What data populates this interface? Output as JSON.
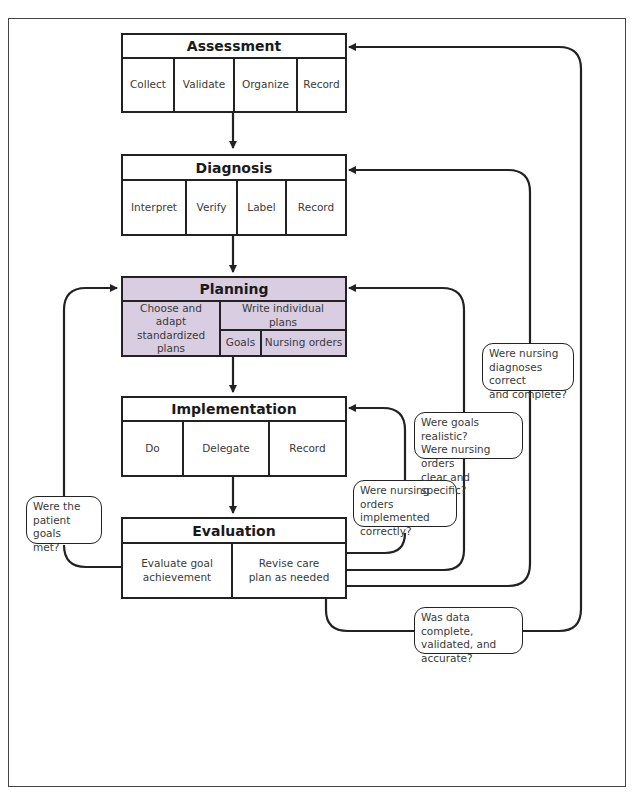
{
  "diagram": {
    "type": "nursing-process-flowchart",
    "highlight_color": "#d9cde2",
    "line_color": "#222222"
  },
  "assessment": {
    "title": "Assessment",
    "steps": [
      "Collect",
      "Validate",
      "Organize",
      "Record"
    ]
  },
  "diagnosis": {
    "title": "Diagnosis",
    "steps": [
      "Interpret",
      "Verify",
      "Label",
      "Record"
    ]
  },
  "planning": {
    "title": "Planning",
    "left": "Choose and adapt standardized plans",
    "right_top": "Write individual plans",
    "right_sub": [
      "Goals",
      "Nursing orders"
    ]
  },
  "implementation": {
    "title": "Implementation",
    "steps": [
      "Do",
      "Delegate",
      "Record"
    ]
  },
  "evaluation": {
    "title": "Evaluation",
    "steps": [
      "Evaluate goal achievement",
      "Revise care plan as needed"
    ]
  },
  "questions": {
    "patient_goals": "Were the\npatient goals\nmet?",
    "orders_implemented": "Were nursing\norders implemented\ncorrectly?",
    "goals_realistic": "Were goals realistic?\nWere nursing orders\nclear and specific?",
    "diagnoses_correct": "Were nursing\ndiagnoses correct\nand complete?",
    "data_complete": "Was data complete,\nvalidated, and\naccurate?"
  }
}
